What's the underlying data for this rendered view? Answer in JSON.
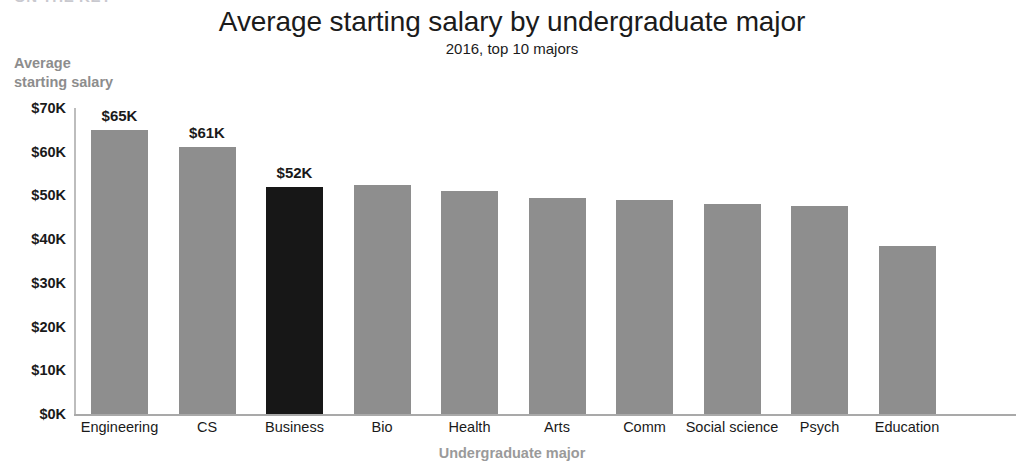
{
  "page": {
    "header_sliver_text": "ON THE KEY"
  },
  "chart_data": {
    "type": "bar",
    "title": "Average starting salary by undergraduate major",
    "subtitle": "2016, top 10 majors",
    "xlabel": "Undergraduate major",
    "ylabel": "Average\nstarting salary",
    "ylabel_line1": "Average",
    "ylabel_line2": "starting salary",
    "grid": false,
    "legend": "none",
    "ylim": [
      0,
      70
    ],
    "y_unit": "thousand US dollars",
    "yticks": [
      0,
      10,
      20,
      30,
      40,
      50,
      60,
      70
    ],
    "ytick_labels": [
      "$0K",
      "$10K",
      "$20K",
      "$30K",
      "$40K",
      "$50K",
      "$60K",
      "$70K"
    ],
    "categories": [
      "Engineering",
      "CS",
      "Business",
      "Bio",
      "Health",
      "Arts",
      "Comm",
      "Social science",
      "Psych",
      "Education"
    ],
    "values": [
      65,
      61,
      52,
      52.5,
      51,
      49.5,
      49,
      48,
      47.5,
      38.5
    ],
    "data_labels": [
      "$65K",
      "$61K",
      "$52K",
      "",
      "",
      "",
      "",
      "",
      "",
      ""
    ],
    "highlight_index": 2,
    "colors": {
      "bar": "#8e8e8e",
      "bar_highlight": "#171717",
      "axis": "#a9a9a9",
      "text": "#1a1a1a",
      "axis_title": "#8d8d8d",
      "background": "#ffffff"
    }
  }
}
